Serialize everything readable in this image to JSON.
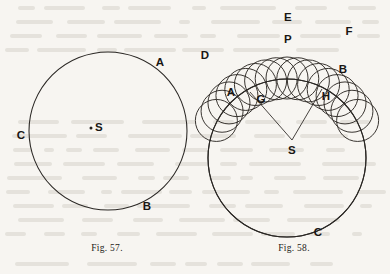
{
  "page": {
    "width": 390,
    "height": 274,
    "background_color": "#f7f5f1",
    "ink_color": "#2a2724",
    "kind": "printed-book-figure-plate"
  },
  "figures": [
    {
      "id": "fig-57",
      "caption": "Fig. 57.",
      "caption_pos": {
        "x": 107,
        "y": 248
      },
      "description": "A single circle with its centre marked S and three points A, B, C marked on the circumference.",
      "main_circle": {
        "cx": 108,
        "cy": 131,
        "r": 79
      },
      "center_dot": {
        "x": 91,
        "y": 128,
        "r": 1.5
      },
      "labels": [
        {
          "name": "A",
          "text": "A",
          "x": 160,
          "y": 63
        },
        {
          "name": "B",
          "text": "B",
          "x": 147,
          "y": 207
        },
        {
          "name": "C",
          "text": "C",
          "x": 21,
          "y": 136
        },
        {
          "name": "S",
          "text": "S",
          "x": 99,
          "y": 128
        }
      ]
    },
    {
      "id": "fig-58",
      "caption": "Fig. 58.",
      "caption_pos": {
        "x": 294,
        "y": 248
      },
      "description": "A large circle of centre S with two radii drawn to points G and H; a family of equal rolling circles between G and H generates an envelope with outer points D, E, F and inner points A, P, B.",
      "main_circle": {
        "cx": 287,
        "cy": 158,
        "r": 79
      },
      "center_point": {
        "x": 292,
        "y": 140
      },
      "radii": [
        {
          "name": "radius-S-G",
          "from": {
            "x": 292,
            "y": 140
          },
          "to": {
            "x": 250,
            "y": 92
          }
        },
        {
          "name": "radius-S-H",
          "from": {
            "x": 292,
            "y": 140
          },
          "to": {
            "x": 322,
            "y": 89
          }
        }
      ],
      "rolling_circles": {
        "count": 17,
        "radius": 21,
        "centre_path_radius": 80,
        "centre_path_cx": 287,
        "centre_path_cy": 158,
        "angle_start_deg": 208,
        "angle_end_deg": 332
      },
      "labels": [
        {
          "name": "D",
          "text": "D",
          "x": 205,
          "y": 56
        },
        {
          "name": "E",
          "text": "E",
          "x": 288,
          "y": 18
        },
        {
          "name": "F",
          "text": "F",
          "x": 349,
          "y": 32
        },
        {
          "name": "P",
          "text": "P",
          "x": 288,
          "y": 40
        },
        {
          "name": "A",
          "text": "A",
          "x": 231,
          "y": 93
        },
        {
          "name": "B",
          "text": "B",
          "x": 343,
          "y": 70
        },
        {
          "name": "G",
          "text": "G",
          "x": 261,
          "y": 100
        },
        {
          "name": "H",
          "text": "H",
          "x": 326,
          "y": 97
        },
        {
          "name": "C",
          "text": "C",
          "x": 318,
          "y": 233
        },
        {
          "name": "S",
          "text": "S",
          "x": 292,
          "y": 151
        }
      ]
    }
  ]
}
